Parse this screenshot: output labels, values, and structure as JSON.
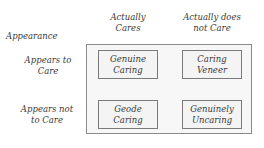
{
  "header": {
    "row_axis_title": "Appearance"
  },
  "columns": [
    {
      "line1": "Actually",
      "line2": "Cares"
    },
    {
      "line1": "Actually does",
      "line2": "not Care"
    }
  ],
  "rows": [
    {
      "line1": "Appears to",
      "line2": "Care"
    },
    {
      "line1": "Appears not",
      "line2": "to Care"
    }
  ],
  "cells": [
    {
      "line1": "Genuine",
      "line2": "Caring"
    },
    {
      "line1": "Caring",
      "line2": "Veneer"
    },
    {
      "line1": "Geode",
      "line2": "Caring"
    },
    {
      "line1": "Genuinely",
      "line2": "Uncaring"
    }
  ]
}
